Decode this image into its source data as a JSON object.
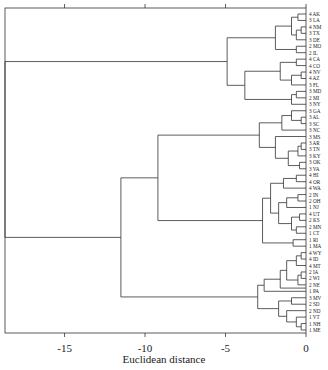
{
  "chart_data": {
    "type": "dendrogram",
    "title": "",
    "xlabel": "Euclidean distance",
    "ylabel": "",
    "xlim": [
      -18.7,
      0
    ],
    "xticks": [
      -15,
      -10,
      -5,
      0
    ],
    "xtick_labels": [
      "-15",
      "-10",
      "-5",
      "0"
    ],
    "grid": false,
    "leaves": [
      "4 AK",
      "3 LA",
      "4 NM",
      "3 TX",
      "3 DE",
      "2 MO",
      "2 IL",
      "4 CA",
      "4 CO",
      "4 NV",
      "4 AZ",
      "3 FL",
      "3 MD",
      "2 MI",
      "3 NY",
      "3 GA",
      "3 AL",
      "3 SC",
      "3 NC",
      "3 MS",
      "3 AR",
      "3 TN",
      "3 KY",
      "3 OK",
      "3 VA",
      "4 HI",
      "4 OR",
      "4 WA",
      "2 IN",
      "2 OH",
      "1 NJ",
      "4 UT",
      "2 KS",
      "2 MN",
      "1 CT",
      "1 RI",
      "1 MA",
      "4 WY",
      "4 ID",
      "4 MT",
      "2 IA",
      "2 WI",
      "2 NE",
      "1 PA",
      "3 MV",
      "2 SD",
      "2 ND",
      "1 VT",
      "1 NH",
      "1 ME"
    ],
    "tree": {
      "h": 18.7,
      "c": [
        {
          "h": 4.9,
          "c": [
            {
              "h": 1.9,
              "c": [
                {
                  "h": 0.9,
                  "c": [
                    {
                      "h": 0.5,
                      "c": [
                        0,
                        1
                      ]
                    },
                    {
                      "h": 0.6,
                      "c": [
                        {
                          "h": 0.3,
                          "c": [
                            2,
                            3
                          ]
                        },
                        4
                      ]
                    }
                  ]
                },
                {
                  "h": 0.6,
                  "c": [
                    5,
                    6
                  ]
                }
              ]
            },
            {
              "h": 3.8,
              "c": [
                {
                  "h": 1.6,
                  "c": [
                    {
                      "h": 0.6,
                      "c": [
                        7,
                        8
                      ]
                    },
                    {
                      "h": 0.9,
                      "c": [
                        {
                          "h": 0.3,
                          "c": [
                            9,
                            10
                          ]
                        },
                        11
                      ]
                    }
                  ]
                },
                {
                  "h": 0.9,
                  "c": [
                    {
                      "h": 0.6,
                      "c": [
                        12,
                        13
                      ]
                    },
                    14
                  ]
                }
              ]
            }
          ]
        },
        {
          "h": 11.5,
          "c": [
            {
              "h": 9.2,
              "c": [
                {
                  "h": 2.9,
                  "c": [
                    {
                      "h": 1.5,
                      "c": [
                        {
                          "h": 0.9,
                          "c": [
                            15,
                            {
                              "h": 0.3,
                              "c": [
                                16,
                                17
                              ]
                            }
                          ]
                        },
                        18
                      ]
                    },
                    {
                      "h": 1.9,
                      "c": [
                        19,
                        {
                          "h": 1.1,
                          "c": [
                            {
                              "h": 0.5,
                              "c": [
                                {
                                  "h": 0.3,
                                  "c": [
                                    20,
                                    21
                                  ]
                                },
                                22
                              ]
                            },
                            {
                              "h": 0.4,
                              "c": [
                                23,
                                24
                              ]
                            }
                          ]
                        }
                      ]
                    }
                  ]
                },
                {
                  "h": 2.7,
                  "c": [
                    {
                      "h": 2.2,
                      "c": [
                        {
                          "h": 1.4,
                          "c": [
                            {
                              "h": 0.6,
                              "c": [
                                25,
                                26
                              ]
                            },
                            27
                          ]
                        },
                        {
                          "h": 1.7,
                          "c": [
                            {
                              "h": 1.2,
                              "c": [
                                {
                                  "h": 0.5,
                                  "c": [
                                    28,
                                    29
                                  ]
                                },
                                30
                              ]
                            },
                            {
                              "h": 0.9,
                              "c": [
                                {
                                  "h": 0.4,
                                  "c": [
                                    31,
                                    32
                                  ]
                                },
                                {
                                  "h": 0.6,
                                  "c": [
                                    33,
                                    34
                                  ]
                                }
                              ]
                            }
                          ]
                        }
                      ]
                    },
                    {
                      "h": 0.8,
                      "c": [
                        35,
                        36
                      ]
                    }
                  ]
                }
              ]
            },
            {
              "h": 3.0,
              "c": [
                {
                  "h": 2.6,
                  "c": [
                    {
                      "h": 1.6,
                      "c": [
                        {
                          "h": 1.2,
                          "c": [
                            {
                              "h": 0.6,
                              "c": [
                                {
                                  "h": 0.3,
                                  "c": [
                                    37,
                                    38
                                  ]
                                },
                                39
                              ]
                            },
                            {
                              "h": 0.5,
                              "c": [
                                {
                                  "h": 0.3,
                                  "c": [
                                    40,
                                    41
                                  ]
                                },
                                42
                              ]
                            }
                          ]
                        },
                        {
                          "h": 0.7,
                          "c": [
                            42.5
                          ]
                        }
                      ]
                    },
                    43
                  ]
                },
                {
                  "h": 1.7,
                  "c": [
                    {
                      "h": 0.9,
                      "c": [
                        44,
                        45
                      ]
                    },
                    {
                      "h": 1.2,
                      "c": [
                        46,
                        {
                          "h": 0.6,
                          "c": [
                            47,
                            {
                              "h": 0.3,
                              "c": [
                                48,
                                49
                              ]
                            }
                          ]
                        }
                      ]
                    }
                  ]
                }
              ]
            }
          ]
        }
      ]
    }
  }
}
